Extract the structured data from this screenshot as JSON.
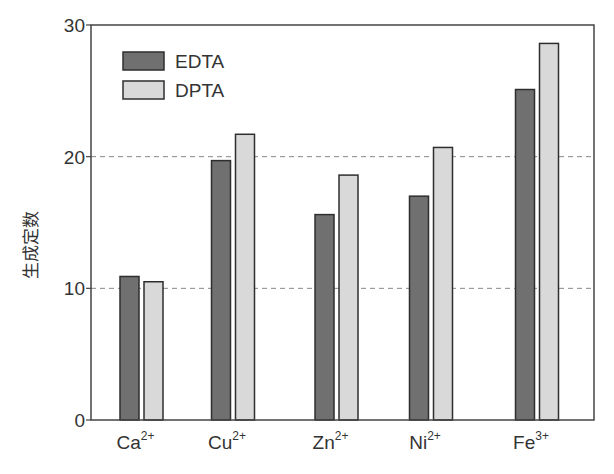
{
  "chart_data": {
    "type": "bar",
    "title": "",
    "xlabel": "",
    "ylabel": "生成定数",
    "ylim": [
      0,
      30
    ],
    "yticks": [
      0,
      10,
      20,
      30
    ],
    "grid": {
      "y": true,
      "style": "dashed",
      "at": [
        10,
        20
      ]
    },
    "legend_position": "upper-left",
    "categories": [
      {
        "base": "Ca",
        "charge": "2+"
      },
      {
        "base": "Cu",
        "charge": "2+"
      },
      {
        "base": "Zn",
        "charge": "2+"
      },
      {
        "base": "Ni",
        "charge": "2+"
      },
      {
        "base": "Fe",
        "charge": "3+"
      }
    ],
    "series": [
      {
        "name": "EDTA",
        "color": "#707070",
        "values": [
          10.9,
          19.7,
          15.6,
          17.0,
          25.1
        ]
      },
      {
        "name": "DPTA",
        "color": "#d9d9d9",
        "values": [
          10.5,
          21.7,
          18.6,
          20.7,
          28.6
        ]
      }
    ]
  }
}
